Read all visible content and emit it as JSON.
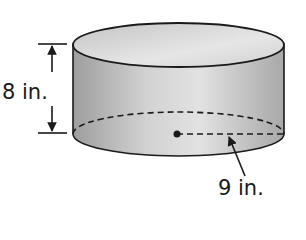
{
  "figure": {
    "shape": "cylinder",
    "height_label": "8 in.",
    "radius_label": "9 in.",
    "colors": {
      "body_light": "#e4e4e4",
      "body_dark": "#9a9a9a",
      "outline": "#1a1a1a"
    }
  }
}
